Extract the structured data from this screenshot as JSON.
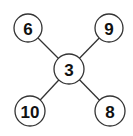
{
  "diagram": {
    "type": "star-graph",
    "center": {
      "id": "c",
      "label": "3",
      "x": 69,
      "y": 69,
      "r": 15
    },
    "leaves": [
      {
        "id": "tl",
        "label": "6",
        "x": 28,
        "y": 28,
        "r": 14
      },
      {
        "id": "tr",
        "label": "9",
        "x": 109,
        "y": 28,
        "r": 14
      },
      {
        "id": "bl",
        "label": "10",
        "x": 30,
        "y": 111,
        "r": 15
      },
      {
        "id": "br",
        "label": "8",
        "x": 110,
        "y": 111,
        "r": 15
      }
    ]
  }
}
